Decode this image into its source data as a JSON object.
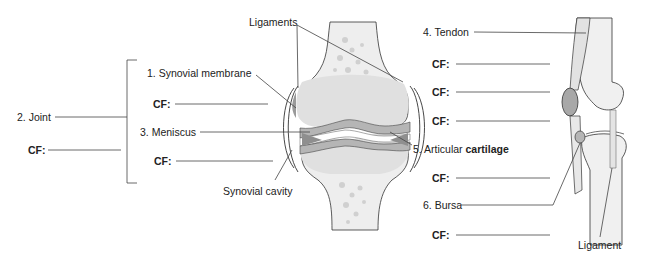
{
  "diagram": {
    "colors": {
      "bone_fill": "#e6e6e6",
      "bone_spongy": "#d3d3d3",
      "cartilage": "#b9b9b9",
      "meniscus": "#9c9c9c",
      "bursa": "#a9a9a9",
      "leader_line": "#444444",
      "outline": "#333333"
    },
    "labels": {
      "ligaments": "Ligaments",
      "synovial_membrane": "1. Synovial membrane",
      "joint": "2. Joint",
      "meniscus": "3. Meniscus",
      "synovial_cavity": "Synovial cavity",
      "tendon": "4. Tendon",
      "articular_prefix": "5. Articular ",
      "articular_bold": "cartilage",
      "bursa": "6. Bursa",
      "ligament": "Ligament"
    },
    "cf_prefix": "CF:",
    "cf_blanks": [
      {
        "id": "synovial-membrane",
        "label": "CF:"
      },
      {
        "id": "joint",
        "label": "CF:"
      },
      {
        "id": "meniscus",
        "label": "CF:"
      },
      {
        "id": "tendon-1",
        "label": "CF:"
      },
      {
        "id": "tendon-2",
        "label": "CF:"
      },
      {
        "id": "tendon-3",
        "label": "CF:"
      },
      {
        "id": "articular-cartilage",
        "label": "CF:"
      },
      {
        "id": "bursa",
        "label": "CF:"
      }
    ]
  }
}
